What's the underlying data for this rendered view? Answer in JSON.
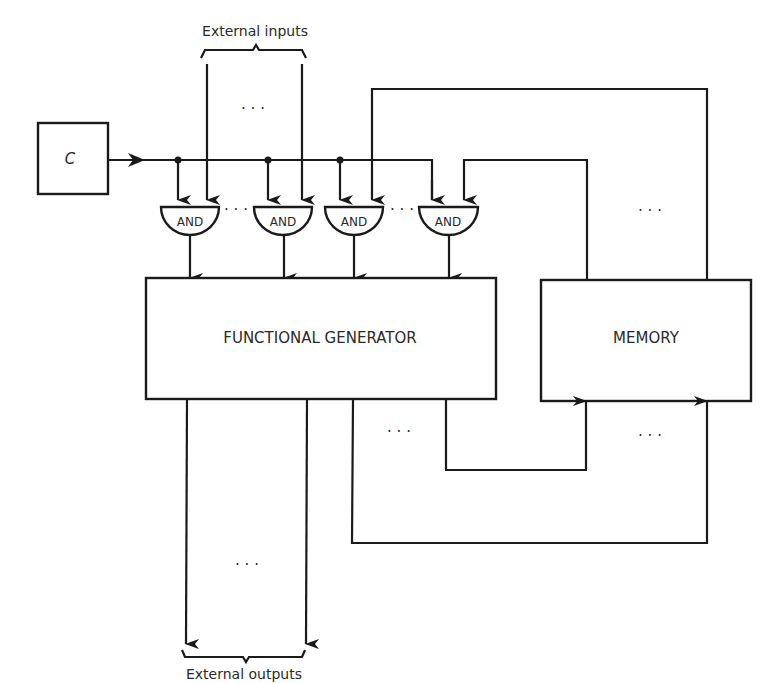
{
  "diagram": {
    "clock_label": "C",
    "external_inputs_label": "External inputs",
    "external_outputs_label": "External outputs",
    "functional_generator_label": "FUNCTIONAL GENERATOR",
    "memory_label": "MEMORY",
    "gates": [
      {
        "label": "AND"
      },
      {
        "label": "AND"
      },
      {
        "label": "AND"
      },
      {
        "label": "AND"
      }
    ],
    "ellipsis": "· · ·",
    "colors": {
      "stroke": "#1a1a1a",
      "background": "#ffffff",
      "text": "#2a2a2a"
    }
  }
}
